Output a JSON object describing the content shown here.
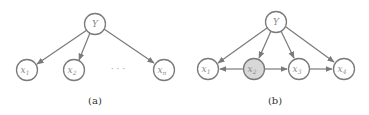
{
  "figure": {
    "panels": [
      {
        "caption": "(a)",
        "nodes": [
          {
            "id": "y",
            "label": "Y",
            "sub": "",
            "cx": 95,
            "cy": 24,
            "observed": false
          },
          {
            "id": "x1",
            "label": "x",
            "sub": "1",
            "cx": 27,
            "cy": 70,
            "observed": false
          },
          {
            "id": "x2",
            "label": "x",
            "sub": "2",
            "cx": 74,
            "cy": 70,
            "observed": false
          },
          {
            "id": "xn",
            "label": "x",
            "sub": "n",
            "cx": 164,
            "cy": 70,
            "observed": false
          }
        ],
        "ellipsis": "· · ·",
        "edges": [
          {
            "from": "y",
            "to": "x1"
          },
          {
            "from": "y",
            "to": "x2"
          },
          {
            "from": "y",
            "to": "xn"
          }
        ]
      },
      {
        "caption": "(b)",
        "nodes": [
          {
            "id": "y",
            "label": "Y",
            "sub": "",
            "cx": 276,
            "cy": 22,
            "observed": false
          },
          {
            "id": "x1",
            "label": "x",
            "sub": "1",
            "cx": 208,
            "cy": 69,
            "observed": false
          },
          {
            "id": "x2",
            "label": "x",
            "sub": "2",
            "cx": 254,
            "cy": 69,
            "observed": true
          },
          {
            "id": "x3",
            "label": "x",
            "sub": "3",
            "cx": 299,
            "cy": 69,
            "observed": false
          },
          {
            "id": "x4",
            "label": "x",
            "sub": "4",
            "cx": 344,
            "cy": 69,
            "observed": false
          }
        ],
        "edges": [
          {
            "from": "y",
            "to": "x1"
          },
          {
            "from": "y",
            "to": "x2"
          },
          {
            "from": "y",
            "to": "x3"
          },
          {
            "from": "y",
            "to": "x4"
          },
          {
            "from": "x2",
            "to": "x1"
          },
          {
            "from": "x2",
            "to": "x3"
          },
          {
            "from": "x3",
            "to": "x4"
          }
        ]
      }
    ]
  }
}
